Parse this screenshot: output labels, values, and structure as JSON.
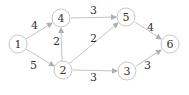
{
  "diagram": {
    "type": "directed-weighted-graph",
    "colors": {
      "node_stroke": "#c8c8c8",
      "edge": "#c4c4c4",
      "text": "#333333"
    },
    "nodes": [
      {
        "id": "1",
        "label": "1",
        "x": 18,
        "y": 44
      },
      {
        "id": "4",
        "label": "4",
        "x": 61,
        "y": 18
      },
      {
        "id": "2",
        "label": "2",
        "x": 63,
        "y": 70
      },
      {
        "id": "5",
        "label": "5",
        "x": 126,
        "y": 17
      },
      {
        "id": "3",
        "label": "3",
        "x": 127,
        "y": 71
      },
      {
        "id": "6",
        "label": "6",
        "x": 170,
        "y": 44
      }
    ],
    "edges": [
      {
        "from": "1",
        "to": "4",
        "weight": "4",
        "lx": 34,
        "ly": 28
      },
      {
        "from": "1",
        "to": "2",
        "weight": "5",
        "lx": 33,
        "ly": 68
      },
      {
        "from": "2",
        "to": "4",
        "weight": "2",
        "lx": 56,
        "ly": 44
      },
      {
        "from": "4",
        "to": "5",
        "weight": "3",
        "lx": 93,
        "ly": 13
      },
      {
        "from": "2",
        "to": "5",
        "weight": "2",
        "lx": 93,
        "ly": 41
      },
      {
        "from": "2",
        "to": "3",
        "weight": "3",
        "lx": 93,
        "ly": 80
      },
      {
        "from": "5",
        "to": "6",
        "weight": "4",
        "lx": 150,
        "ly": 30
      },
      {
        "from": "3",
        "to": "6",
        "weight": "3",
        "lx": 147,
        "ly": 68
      }
    ]
  }
}
